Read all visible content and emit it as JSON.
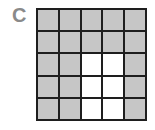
{
  "label": "C",
  "grid": {
    "rows": 5,
    "cols": 5,
    "shaded_color": "#c6c6c6",
    "unshaded_color": "#ffffff",
    "cells": [
      [
        1,
        1,
        1,
        1,
        1
      ],
      [
        1,
        1,
        1,
        1,
        1
      ],
      [
        1,
        1,
        0,
        0,
        1
      ],
      [
        1,
        1,
        0,
        0,
        1
      ],
      [
        1,
        1,
        0,
        0,
        1
      ]
    ],
    "shaded_count": 19,
    "unshaded_count": 6
  }
}
